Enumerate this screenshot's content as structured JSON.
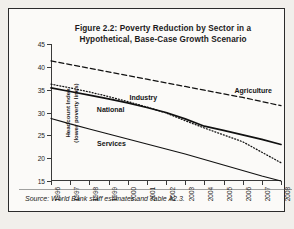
{
  "figure": {
    "title_line1": "Figure 2.2: Poverty Reduction by Sector in a",
    "title_line2": "Hypothetical, Base-Case Growth Scenario",
    "source": "Source: World Bank staff estimates and Table A2.3.",
    "ylabel_line1": "Headcount Index",
    "ylabel_line2": "(lower poverty lines)"
  },
  "chart_data": {
    "type": "line",
    "title": "Figure 2.2: Poverty Reduction by Sector in a Hypothetical, Base-Case Growth Scenario",
    "xlabel": "",
    "ylabel": "Headcount Index (lower poverty lines)",
    "x": [
      "1996",
      "1997",
      "1998",
      "1999",
      "2000",
      "2001",
      "2002",
      "2003",
      "2004",
      "2005",
      "2006",
      "2007",
      "2008"
    ],
    "categories": [
      "1996",
      "1997",
      "1998",
      "1999",
      "2000",
      "2001",
      "2002",
      "2003",
      "2004",
      "2005",
      "2006",
      "2007",
      "2008"
    ],
    "yticks": [
      15,
      20,
      25,
      30,
      35,
      40,
      45
    ],
    "ylim": [
      15,
      45
    ],
    "grid": false,
    "legend": "inline-annotations",
    "series": [
      {
        "name": "Agriculture",
        "style": "dashed",
        "values": [
          41.3,
          40.5,
          39.7,
          38.9,
          38.1,
          37.3,
          36.5,
          35.7,
          34.9,
          34.1,
          33.3,
          32.4,
          31.5
        ]
      },
      {
        "name": "Industry",
        "style": "dotted",
        "values": [
          36.2,
          35.4,
          34.5,
          33.5,
          32.4,
          31.2,
          29.9,
          28.2,
          26.6,
          25.1,
          23.6,
          21.3,
          19.0
        ]
      },
      {
        "name": "National",
        "style": "solid-thick",
        "values": [
          35.4,
          34.6,
          33.8,
          33.0,
          32.1,
          31.1,
          30.0,
          28.6,
          27.0,
          26.1,
          25.1,
          24.1,
          23.0
        ]
      },
      {
        "name": "Services",
        "style": "solid",
        "values": [
          28.7,
          27.5,
          26.4,
          25.3,
          24.2,
          23.1,
          22.0,
          20.9,
          19.7,
          18.5,
          17.3,
          16.1,
          15.0
        ]
      }
    ],
    "annotations": [
      {
        "text": "Agriculture",
        "series": "Agriculture"
      },
      {
        "text": "Industry",
        "series": "Industry"
      },
      {
        "text": "National",
        "series": "National"
      },
      {
        "text": "Services",
        "series": "Services"
      }
    ]
  }
}
